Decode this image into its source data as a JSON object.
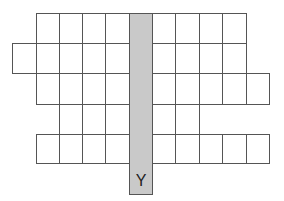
{
  "diagram": {
    "title": "",
    "grid_lines_color": "#555555",
    "highlight_color": "#c9c9c9",
    "column_x": [
      12,
      36,
      59,
      82,
      105,
      129,
      152,
      175,
      199,
      222,
      246,
      269
    ],
    "row_y": [
      13,
      43,
      73,
      104,
      134,
      163
    ],
    "rows": [
      {
        "index": 1,
        "left_cells": 4,
        "right_cells": 4
      },
      {
        "index": 2,
        "left_cells": 5,
        "right_cells": 4
      },
      {
        "index": 3,
        "left_cells": 4,
        "right_cells": 5
      },
      {
        "index": 4,
        "left_cells": 3,
        "right_cells": 2
      },
      {
        "index": 5,
        "left_cells": 4,
        "right_cells": 5
      }
    ],
    "highlight_column": {
      "label": "Y",
      "x": 129,
      "width": 23,
      "top": 13,
      "bottom": 195
    }
  }
}
